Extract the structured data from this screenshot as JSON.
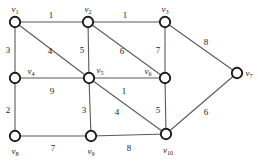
{
  "figure": {
    "type": "weighted-undirected-graph",
    "width": 258,
    "height": 167,
    "background_color": "#ffffff",
    "edge_color": "#5a5a5a",
    "node_stroke_color": "#1a1a1a",
    "node_fill_color": "#ffffff",
    "label_color": "#232323"
  },
  "nodes": [
    {
      "id": "v1",
      "label": "v",
      "sub": "1",
      "x": 15,
      "y": 22,
      "r": 5.2,
      "label_x": 15,
      "label_y": 9
    },
    {
      "id": "v2",
      "label": "v",
      "sub": "2",
      "x": 88,
      "y": 22,
      "r": 5.2,
      "label_x": 88,
      "label_y": 9
    },
    {
      "id": "v3",
      "label": "v",
      "sub": "3",
      "x": 165,
      "y": 22,
      "r": 5.2,
      "label_x": 165,
      "label_y": 9
    },
    {
      "id": "v4",
      "label": "v",
      "sub": "4",
      "x": 15,
      "y": 78,
      "r": 5.2,
      "label_x": 31,
      "label_y": 71
    },
    {
      "id": "v5",
      "label": "v",
      "sub": "5",
      "x": 89,
      "y": 78,
      "r": 5.2,
      "label_x": 100,
      "label_y": 70
    },
    {
      "id": "v6",
      "label": "v",
      "sub": "6",
      "x": 165,
      "y": 78,
      "r": 5.2,
      "label_x": 148,
      "label_y": 71
    },
    {
      "id": "v7",
      "label": "v",
      "sub": "7",
      "x": 237,
      "y": 73,
      "r": 5.2,
      "label_x": 249,
      "label_y": 73
    },
    {
      "id": "v8",
      "label": "v",
      "sub": "8",
      "x": 15,
      "y": 136,
      "r": 5.2,
      "label_x": 15,
      "label_y": 151
    },
    {
      "id": "v9",
      "label": "v",
      "sub": "9",
      "x": 91,
      "y": 136,
      "r": 5.2,
      "label_x": 91,
      "label_y": 151
    },
    {
      "id": "v10",
      "label": "v",
      "sub": "10",
      "x": 166,
      "y": 134,
      "r": 5.2,
      "label_x": 168,
      "label_y": 150
    }
  ],
  "edges": [
    {
      "from": "v1",
      "to": "v2",
      "weight": "1",
      "label_x": 51,
      "label_y": 15
    },
    {
      "from": "v2",
      "to": "v3",
      "weight": "1",
      "label_x": 125,
      "label_y": 15
    },
    {
      "from": "v1",
      "to": "v4",
      "weight": "3",
      "label_x": 8,
      "label_y": 50
    },
    {
      "from": "v1",
      "to": "v5",
      "weight": "4",
      "label_x": 50,
      "label_y": 51
    },
    {
      "from": "v2",
      "to": "v5",
      "weight": "5",
      "label_x": 82,
      "label_y": 50
    },
    {
      "from": "v2",
      "to": "v6",
      "weight": "6",
      "label_x": 122,
      "label_y": 51
    },
    {
      "from": "v3",
      "to": "v6",
      "weight": "7",
      "label_x": 158,
      "label_y": 50
    },
    {
      "from": "v3",
      "to": "v7",
      "weight": "8",
      "label_x": 206,
      "label_y": 42
    },
    {
      "from": "v4",
      "to": "v5",
      "weight": "9",
      "label_x": 52,
      "label_y": 91
    },
    {
      "from": "v5",
      "to": "v6",
      "weight": "1",
      "label_x": 124,
      "label_y": 91
    },
    {
      "from": "v4",
      "to": "v8",
      "weight": "2",
      "label_x": 8,
      "label_y": 110
    },
    {
      "from": "v5",
      "to": "v9",
      "weight": "3",
      "label_x": 84,
      "label_y": 110
    },
    {
      "from": "v5",
      "to": "v10",
      "weight": "4",
      "label_x": 117,
      "label_y": 112
    },
    {
      "from": "v6",
      "to": "v10",
      "weight": "5",
      "label_x": 158,
      "label_y": 110
    },
    {
      "from": "v10",
      "to": "v7",
      "weight": "6",
      "label_x": 206,
      "label_y": 112
    },
    {
      "from": "v8",
      "to": "v9",
      "weight": "7",
      "label_x": 53,
      "label_y": 148
    },
    {
      "from": "v9",
      "to": "v10",
      "weight": "8",
      "label_x": 129,
      "label_y": 148
    }
  ]
}
